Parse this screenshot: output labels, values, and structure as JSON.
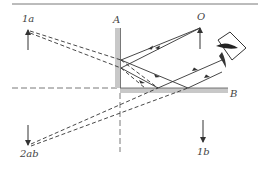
{
  "figure": {
    "labels": {
      "mirror_a": "A",
      "mirror_b": "B",
      "object": "O",
      "image_1a": "1a",
      "image_1b": "1b",
      "image_2ab": "2ab"
    },
    "colors": {
      "mirror": "#c8c8c8",
      "lines": "#333333",
      "background": "#ffffff"
    }
  }
}
